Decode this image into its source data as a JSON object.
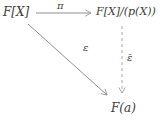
{
  "diagram": {
    "type": "commutative-diagram",
    "nodes": {
      "top_left": "F[X]",
      "top_right": "F[X]/(p(X))",
      "bottom": "F(a)"
    },
    "arrows": [
      {
        "from": "F[X]",
        "to": "F[X]/(p(X))",
        "label": "π",
        "style": "solid"
      },
      {
        "from": "F[X]",
        "to": "F(a)",
        "label": "ε",
        "style": "solid"
      },
      {
        "from": "F[X]/(p(X))",
        "to": "F(a)",
        "label": "ε̄",
        "style": "dashed"
      }
    ],
    "labels": {
      "pi": "π",
      "epsilon": "ε",
      "epsilon_bar": "ε̄"
    },
    "colors": {
      "background": "#ffffff",
      "line": "#909090",
      "dashed_line": "#a8a8a8",
      "text": "#3d3d3d"
    }
  }
}
